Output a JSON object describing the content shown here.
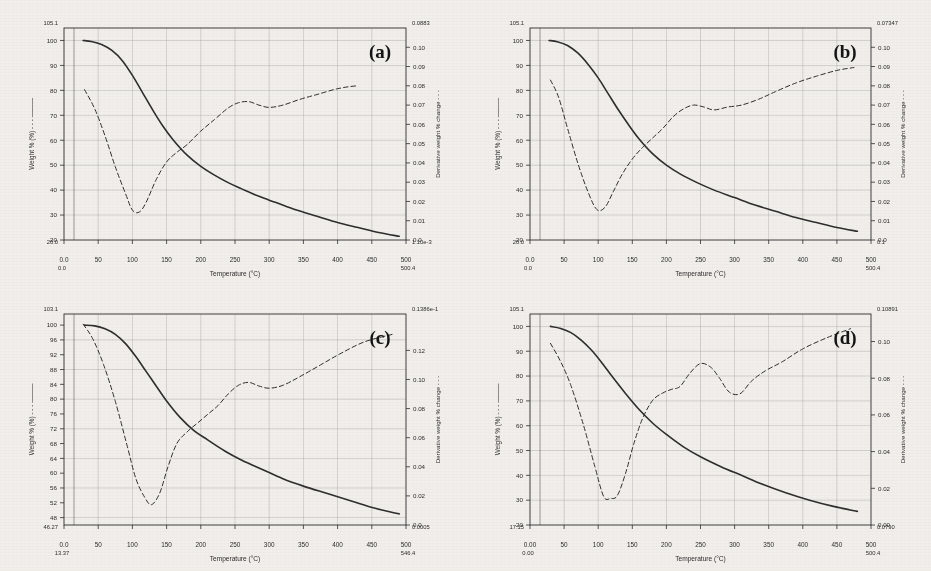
{
  "figure": {
    "background_color": "#f4f2ee",
    "ink_color": "#2b2b2b",
    "grid_color": "#9a9a9a"
  },
  "chart_data": [
    {
      "type": "line",
      "panel_label": "(a)",
      "title": "",
      "xlabel": "Temperature (°C)",
      "ylabel": "Weight % (%)",
      "y2label": "Derivative weight % change",
      "xlim": [
        0,
        500
      ],
      "ylim": [
        20,
        105
      ],
      "y2lim": [
        0.0,
        0.11
      ],
      "xticks": [
        0,
        50,
        100,
        150,
        200,
        250,
        300,
        350,
        400,
        450,
        500
      ],
      "xticklabels": [
        "0.0",
        "50",
        "100",
        "150",
        "200",
        "250",
        "300",
        "350",
        "400",
        "450",
        "500"
      ],
      "x_axis_start_label": "0.0",
      "x_axis_end_label": "500.4",
      "yticks": [
        20,
        30,
        40,
        50,
        60,
        70,
        80,
        90,
        100
      ],
      "yticklabels": [
        "20",
        "30",
        "40",
        "50",
        "60",
        "70",
        "80",
        "90",
        "100"
      ],
      "y_top_label": "105.1",
      "y_bottom_label": "20.0",
      "y2ticks": [
        0.0,
        0.01,
        0.02,
        0.03,
        0.04,
        0.05,
        0.06,
        0.07,
        0.08,
        0.09,
        0.1
      ],
      "y2ticklabels": [
        "0.0",
        "0.01",
        "0.02",
        "0.03",
        "0.04",
        "0.05",
        "0.06",
        "0.07",
        "0.08",
        "0.09",
        "0.10"
      ],
      "y2_top_label": "0.0883",
      "y2_bottom_label": "1.10e-3",
      "grid": true,
      "series": [
        {
          "name": "Weight %",
          "style": "solid",
          "axis": "left",
          "x": [
            28,
            40,
            55,
            70,
            85,
            100,
            115,
            130,
            145,
            160,
            180,
            200,
            220,
            240,
            260,
            285,
            310,
            340,
            370,
            400,
            430,
            460,
            490
          ],
          "values": [
            100.0,
            99.6,
            98.4,
            96.0,
            92.0,
            86.0,
            79.0,
            72.0,
            65.5,
            60.0,
            54.0,
            49.5,
            46.0,
            43.0,
            40.5,
            37.5,
            35.0,
            32.0,
            29.5,
            27.0,
            25.0,
            23.0,
            21.5
          ]
        },
        {
          "name": "Derivative weight % change",
          "style": "dashed",
          "axis": "right",
          "x": [
            30,
            45,
            60,
            75,
            90,
            100,
            110,
            120,
            135,
            150,
            165,
            180,
            200,
            220,
            240,
            255,
            270,
            285,
            300,
            320,
            345,
            370,
            400,
            430,
            460,
            485
          ],
          "values": [
            0.078,
            0.068,
            0.054,
            0.038,
            0.024,
            0.0155,
            0.0145,
            0.0195,
            0.0315,
            0.0405,
            0.0455,
            0.0495,
            0.0565,
            0.0625,
            0.0685,
            0.0712,
            0.0718,
            0.07,
            0.0688,
            0.07,
            0.073,
            0.0755,
            0.0785,
            0.08,
            0.0795
          ]
        }
      ]
    },
    {
      "type": "line",
      "panel_label": "(b)",
      "title": "",
      "xlabel": "Temperature (°C)",
      "ylabel": "Weight % (%)",
      "y2label": "Derivative weight % change",
      "xlim": [
        0,
        500
      ],
      "ylim": [
        20,
        105
      ],
      "y2lim": [
        0.0,
        0.11
      ],
      "xticks": [
        0,
        50,
        100,
        150,
        200,
        250,
        300,
        350,
        400,
        450,
        500
      ],
      "xticklabels": [
        "0.0",
        "50",
        "100",
        "150",
        "200",
        "250",
        "300",
        "350",
        "400",
        "450",
        "500"
      ],
      "x_axis_start_label": "0.0",
      "x_axis_end_label": "500.4",
      "yticks": [
        20,
        30,
        40,
        50,
        60,
        70,
        80,
        90,
        100
      ],
      "yticklabels": [
        "20",
        "30",
        "40",
        "50",
        "60",
        "70",
        "80",
        "90",
        "100"
      ],
      "y_top_label": "105.1",
      "y_bottom_label": "20.0",
      "y2ticks": [
        0.0,
        0.01,
        0.02,
        0.03,
        0.04,
        0.05,
        0.06,
        0.07,
        0.08,
        0.09,
        0.1
      ],
      "y2ticklabels": [
        "0.0",
        "0.01",
        "0.02",
        "0.03",
        "0.04",
        "0.05",
        "0.06",
        "0.07",
        "0.08",
        "0.09",
        "0.10"
      ],
      "y2_top_label": "0.07347",
      "y2_bottom_label": "0.1",
      "grid": true,
      "series": [
        {
          "name": "Weight %",
          "style": "solid",
          "axis": "left",
          "x": [
            28,
            40,
            55,
            70,
            85,
            100,
            115,
            130,
            145,
            160,
            180,
            200,
            220,
            245,
            270,
            300,
            330,
            360,
            390,
            420,
            450,
            480
          ],
          "values": [
            100.0,
            99.5,
            98.0,
            95.0,
            90.5,
            85.0,
            78.5,
            72.0,
            66.0,
            60.5,
            54.5,
            50.0,
            46.5,
            43.0,
            40.0,
            37.0,
            34.0,
            31.5,
            29.0,
            27.0,
            25.0,
            23.5
          ]
        },
        {
          "name": "Derivative weight % change",
          "style": "dashed",
          "axis": "right",
          "x": [
            30,
            42,
            55,
            70,
            85,
            98,
            110,
            122,
            135,
            150,
            165,
            180,
            195,
            210,
            225,
            240,
            255,
            270,
            290,
            310,
            335,
            360,
            390,
            420,
            450,
            475
          ],
          "values": [
            0.083,
            0.074,
            0.058,
            0.04,
            0.025,
            0.0158,
            0.017,
            0.025,
            0.034,
            0.042,
            0.048,
            0.053,
            0.058,
            0.064,
            0.068,
            0.07,
            0.069,
            0.0675,
            0.069,
            0.07,
            0.073,
            0.077,
            0.0815,
            0.085,
            0.088,
            0.0895
          ]
        }
      ]
    },
    {
      "type": "line",
      "panel_label": "(c)",
      "title": "",
      "xlabel": "Temperature (°C)",
      "ylabel": "Weight % (%)",
      "y2label": "Derivative weight % change",
      "xlim": [
        0,
        500
      ],
      "ylim": [
        46,
        103
      ],
      "y2lim": [
        0.0,
        0.145
      ],
      "xticks": [
        0,
        50,
        100,
        150,
        200,
        250,
        300,
        350,
        400,
        450,
        500
      ],
      "xticklabels": [
        "0.0",
        "50",
        "100",
        "150",
        "200",
        "250",
        "300",
        "350",
        "400",
        "450",
        "500"
      ],
      "x_axis_start_label": "13.37",
      "x_axis_end_label": "546.4",
      "yticks": [
        48,
        52,
        56,
        60,
        64,
        68,
        72,
        76,
        80,
        84,
        88,
        92,
        96,
        100
      ],
      "yticklabels": [
        "48",
        "52",
        "56",
        "60",
        "64",
        "68",
        "72",
        "76",
        "80",
        "84",
        "88",
        "92",
        "96",
        "100"
      ],
      "y_top_label": "103.1",
      "y_bottom_label": "46.27",
      "y2ticks": [
        0.0,
        0.02,
        0.04,
        0.06,
        0.08,
        0.1,
        0.12
      ],
      "y2ticklabels": [
        "0.0",
        "0.02",
        "0.04",
        "0.06",
        "0.08",
        "0.10",
        "0.12"
      ],
      "y2_top_label": "0.1386e-1",
      "y2_bottom_label": "0.0005",
      "grid": true,
      "series": [
        {
          "name": "Weight %",
          "style": "solid",
          "axis": "left",
          "x": [
            30,
            45,
            60,
            75,
            90,
            105,
            120,
            135,
            150,
            170,
            190,
            210,
            235,
            260,
            290,
            320,
            350,
            385,
            420,
            455,
            490
          ],
          "values": [
            100.0,
            99.8,
            99.0,
            97.5,
            95.0,
            91.5,
            87.5,
            83.5,
            79.5,
            75.0,
            71.5,
            69.0,
            66.0,
            63.5,
            61.0,
            58.5,
            56.5,
            54.5,
            52.5,
            50.5,
            49.0
          ]
        },
        {
          "name": "Derivative weight % change",
          "style": "dashed",
          "axis": "right",
          "x": [
            28,
            42,
            58,
            75,
            92,
            105,
            118,
            128,
            140,
            152,
            165,
            180,
            195,
            210,
            225,
            240,
            255,
            270,
            285,
            300,
            320,
            345,
            375,
            405,
            440,
            480
          ],
          "values": [
            0.138,
            0.128,
            0.11,
            0.085,
            0.055,
            0.032,
            0.019,
            0.014,
            0.022,
            0.04,
            0.056,
            0.064,
            0.07,
            0.076,
            0.082,
            0.09,
            0.096,
            0.098,
            0.0955,
            0.094,
            0.096,
            0.102,
            0.11,
            0.118,
            0.126,
            0.131
          ]
        }
      ]
    },
    {
      "type": "line",
      "panel_label": "(d)",
      "title": "",
      "xlabel": "Temperature (°C)",
      "ylabel": "Weight % (%)",
      "y2label": "Derivative weight % change",
      "xlim": [
        0,
        500
      ],
      "ylim": [
        20,
        105
      ],
      "y2lim": [
        0.0,
        0.115
      ],
      "xticks": [
        0,
        50,
        100,
        150,
        200,
        250,
        300,
        350,
        400,
        450,
        500
      ],
      "xticklabels": [
        "0.00",
        "50",
        "100",
        "150",
        "200",
        "250",
        "300",
        "350",
        "400",
        "450",
        "500"
      ],
      "x_axis_start_label": "0.00",
      "x_axis_end_label": "500.4",
      "yticks": [
        20,
        30,
        40,
        50,
        60,
        70,
        80,
        90,
        100
      ],
      "yticklabels": [
        "20",
        "30",
        "40",
        "50",
        "60",
        "70",
        "80",
        "90",
        "100"
      ],
      "y_top_label": "105.1",
      "y_bottom_label": "17.15",
      "y2ticks": [
        0.0,
        0.02,
        0.04,
        0.06,
        0.08,
        0.1
      ],
      "y2ticklabels": [
        "0.00",
        "0.02",
        "0.04",
        "0.06",
        "0.08",
        "0.10"
      ],
      "y2_top_label": "0.10891",
      "y2_bottom_label": "0.0790",
      "grid": true,
      "series": [
        {
          "name": "Weight %",
          "style": "solid",
          "axis": "left",
          "x": [
            30,
            45,
            60,
            75,
            90,
            105,
            120,
            140,
            160,
            180,
            200,
            225,
            250,
            280,
            310,
            340,
            375,
            410,
            445,
            480
          ],
          "values": [
            100.0,
            99.2,
            97.5,
            94.5,
            90.5,
            85.5,
            80.0,
            73.0,
            66.5,
            61.0,
            56.5,
            51.5,
            47.5,
            43.5,
            40.0,
            36.5,
            33.0,
            30.0,
            27.5,
            25.5
          ]
        },
        {
          "name": "Derivative weight % change",
          "style": "dashed",
          "axis": "right",
          "x": [
            30,
            45,
            60,
            78,
            95,
            108,
            118,
            128,
            140,
            152,
            165,
            180,
            195,
            208,
            220,
            235,
            250,
            265,
            278,
            292,
            308,
            325,
            345,
            370,
            400,
            435,
            470
          ],
          "values": [
            0.099,
            0.089,
            0.076,
            0.055,
            0.032,
            0.0155,
            0.0145,
            0.016,
            0.028,
            0.044,
            0.058,
            0.068,
            0.072,
            0.074,
            0.0755,
            0.083,
            0.088,
            0.086,
            0.08,
            0.0725,
            0.0715,
            0.0785,
            0.084,
            0.089,
            0.096,
            0.102,
            0.107
          ]
        }
      ]
    }
  ]
}
